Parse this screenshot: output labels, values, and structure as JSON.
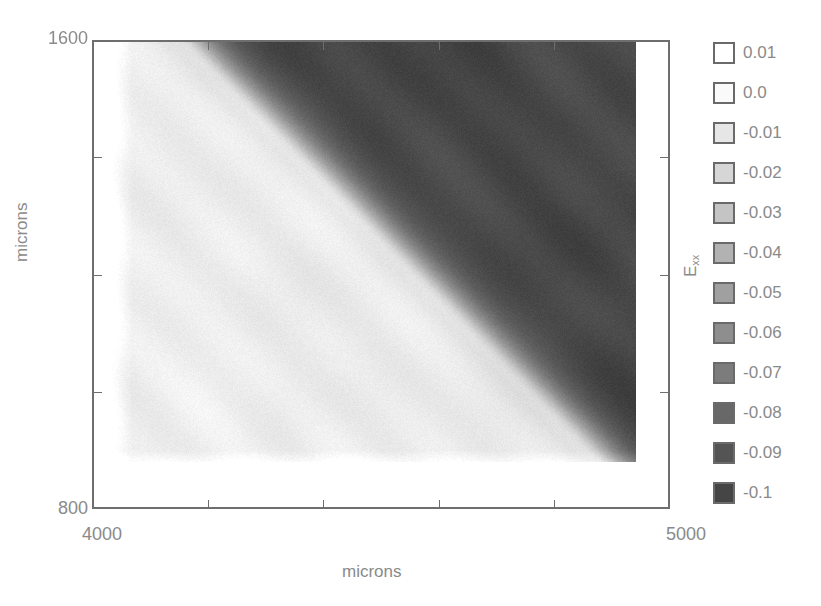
{
  "chart_data": {
    "type": "heatmap",
    "title": "",
    "xlabel": "microns",
    "ylabel": "microns",
    "colorbar_label": "E_xx",
    "colorbar_label_main": "E",
    "colorbar_label_sub": "xx",
    "xlim": [
      4000,
      5000
    ],
    "ylim": [
      800,
      1600
    ],
    "x_ticks": [
      4000,
      4200,
      4400,
      4600,
      4800,
      5000
    ],
    "x_tick_labels": [
      "4000",
      "",
      "",
      "",
      "",
      "5000"
    ],
    "y_ticks": [
      800,
      1000,
      1200,
      1400,
      1600
    ],
    "y_tick_labels": [
      "800",
      "",
      "",
      "",
      "1600"
    ],
    "grid": false,
    "legend_position": "right",
    "data_extent": {
      "x": [
        4035,
        4941
      ],
      "y": [
        893,
        1600
      ]
    },
    "regions": [
      {
        "name": "compressed-region",
        "approx_value": -0.09,
        "location": "upper-right"
      },
      {
        "name": "boundary-band",
        "approx_value": 0.0,
        "location": "diagonal"
      },
      {
        "name": "relaxed-region",
        "approx_value": -0.015,
        "location": "lower-left"
      }
    ],
    "legend": [
      {
        "label": "0.01",
        "value": 0.01,
        "color": "#ffffff"
      },
      {
        "label": "0.0",
        "value": 0.0,
        "color": "#fafafa"
      },
      {
        "label": "-0.01",
        "value": -0.01,
        "color": "#e6e6e6"
      },
      {
        "label": "-0.02",
        "value": -0.02,
        "color": "#d6d6d6"
      },
      {
        "label": "-0.03",
        "value": -0.03,
        "color": "#c4c4c4"
      },
      {
        "label": "-0.04",
        "value": -0.04,
        "color": "#b2b2b2"
      },
      {
        "label": "-0.05",
        "value": -0.05,
        "color": "#a0a0a0"
      },
      {
        "label": "-0.06",
        "value": -0.06,
        "color": "#8e8e8e"
      },
      {
        "label": "-0.07",
        "value": -0.07,
        "color": "#7c7c7c"
      },
      {
        "label": "-0.08",
        "value": -0.08,
        "color": "#686868"
      },
      {
        "label": "-0.09",
        "value": -0.09,
        "color": "#545454"
      },
      {
        "label": "-0.1",
        "value": -0.1,
        "color": "#454545"
      }
    ]
  },
  "render": {
    "boundary_line": {
      "x1": 205,
      "y1": 42,
      "x2": 620,
      "y2": 462
    },
    "dark_color": [
      72,
      72,
      72
    ],
    "light_color": [
      236,
      236,
      236
    ],
    "stripe_color": [
      248,
      248,
      248
    ]
  }
}
